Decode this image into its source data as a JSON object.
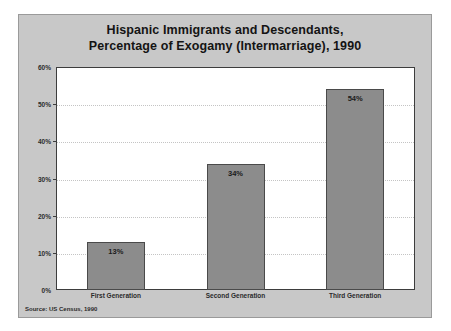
{
  "chart_data": {
    "type": "bar",
    "title": "Hispanic Immigrants and Descendants, Percentage of Exogamy (Intermarriage), 1990",
    "title_lines": [
      "Hispanic Immigrants and Descendants,",
      "Percentage of Exogamy (Intermarriage), 1990"
    ],
    "categories": [
      "First Generation",
      "Second Generation",
      "Third Generation"
    ],
    "values": [
      13,
      34,
      54
    ],
    "value_labels": [
      "13%",
      "34%",
      "54%"
    ],
    "xlabel": "",
    "ylabel": "",
    "ylim": [
      0,
      60
    ],
    "y_ticks": [
      0,
      10,
      20,
      30,
      40,
      50,
      60
    ],
    "y_tick_labels": [
      "0%",
      "10%",
      "20%",
      "30%",
      "40%",
      "50%",
      "60%"
    ],
    "grid": true,
    "legend": false,
    "source": "Source: US Census, 1990",
    "colors": {
      "figure_background": "#c8c8c8",
      "plot_background": "#ffffff",
      "bar_fill": "#8c8c8c",
      "bar_border": "#4a4a4a",
      "axis": "#3d3d3d",
      "gridline": "#c4c4c4",
      "text": "#1a1a1a"
    }
  }
}
